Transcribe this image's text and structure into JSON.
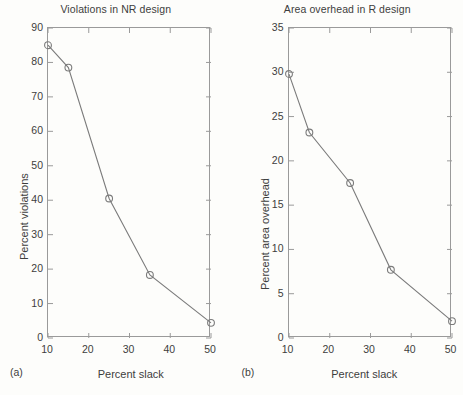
{
  "figure": {
    "background_color": "#fdfdfb",
    "line_color": "#7b7b7b",
    "axis_color": "#9a9a9a",
    "text_color": "#3d3d3d"
  },
  "panels": [
    {
      "tag": "(a)",
      "title": "Violations in NR design",
      "xlabel": "Percent slack",
      "ylabel": "Percent violations",
      "xticks": [
        "10",
        "20",
        "30",
        "40",
        "50"
      ],
      "yticks": [
        "0",
        "10",
        "20",
        "30",
        "40",
        "50",
        "60",
        "70",
        "80",
        "90"
      ]
    },
    {
      "tag": "(b)",
      "title": "Area overhead in R design",
      "xlabel": "Percent slack",
      "ylabel": "Percent area overhead",
      "xticks": [
        "10",
        "20",
        "30",
        "40",
        "50"
      ],
      "yticks": [
        "0",
        "5",
        "10",
        "15",
        "20",
        "25",
        "30",
        "35"
      ]
    }
  ],
  "chart_data": [
    {
      "type": "line",
      "title": "Violations in NR design",
      "subplot_label": "(a)",
      "xlabel": "Percent slack",
      "ylabel": "Percent violations",
      "xlim": [
        10,
        50
      ],
      "ylim": [
        0,
        90
      ],
      "xticks": [
        10,
        20,
        30,
        40,
        50
      ],
      "yticks": [
        0,
        10,
        20,
        30,
        40,
        50,
        60,
        70,
        80,
        90
      ],
      "grid": false,
      "legend": null,
      "marker": "open-circle",
      "x": [
        10,
        15,
        25,
        35,
        50
      ],
      "values": [
        85.0,
        78.5,
        40.5,
        18.3,
        4.4
      ]
    },
    {
      "type": "line",
      "title": "Area overhead in R design",
      "subplot_label": "(b)",
      "xlabel": "Percent slack",
      "ylabel": "Percent area overhead",
      "xlim": [
        10,
        50
      ],
      "ylim": [
        0,
        35
      ],
      "xticks": [
        10,
        20,
        30,
        40,
        50
      ],
      "yticks": [
        0,
        5,
        10,
        15,
        20,
        25,
        30,
        35
      ],
      "grid": false,
      "legend": null,
      "marker": "open-circle",
      "x": [
        10,
        15,
        25,
        35,
        50
      ],
      "values": [
        29.8,
        23.2,
        17.5,
        7.7,
        1.9
      ]
    }
  ]
}
